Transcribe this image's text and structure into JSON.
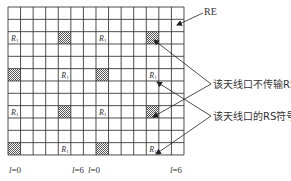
{
  "diagram": {
    "grid": {
      "columns": 14,
      "rows": 12,
      "x0": 8,
      "y0": 7,
      "cell_w": 12.57,
      "cell_h": 12.33,
      "line_color": "#3a3a3a"
    },
    "rs_cells": [
      {
        "row": 2,
        "col": 0
      },
      {
        "row": 2,
        "col": 7
      },
      {
        "row": 5,
        "col": 4
      },
      {
        "row": 5,
        "col": 11
      },
      {
        "row": 8,
        "col": 0
      },
      {
        "row": 8,
        "col": 7
      },
      {
        "row": 11,
        "col": 4
      },
      {
        "row": 11,
        "col": 11
      }
    ],
    "hatched_cells": [
      {
        "row": 2,
        "col": 4
      },
      {
        "row": 2,
        "col": 11
      },
      {
        "row": 5,
        "col": 0
      },
      {
        "row": 5,
        "col": 7
      },
      {
        "row": 8,
        "col": 4
      },
      {
        "row": 8,
        "col": 11
      },
      {
        "row": 11,
        "col": 0
      },
      {
        "row": 11,
        "col": 7
      }
    ],
    "rs_symbol": {
      "main": "R",
      "sub": "1"
    },
    "labels": {
      "re": "RE",
      "no_rs": "该天线口不传输RS",
      "rs_symbol": "该天线口的RS符号"
    },
    "axis_labels": [
      {
        "text_var": "l",
        "text_val": "=0",
        "x": 9
      },
      {
        "text_var": "l",
        "text_val": "=6",
        "x": 72
      },
      {
        "text_var": "l",
        "text_val": "=0",
        "x": 88
      },
      {
        "text_var": "l",
        "text_val": "=6",
        "x": 170
      }
    ]
  }
}
